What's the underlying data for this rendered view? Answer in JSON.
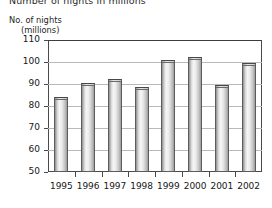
{
  "chart_data": {
    "type": "bar",
    "title": "Number of nights in millions",
    "ylabel_line1": "No. of nights",
    "ylabel_line2": "(millions)",
    "xlabel": "",
    "categories": [
      "1995",
      "1996",
      "1997",
      "1998",
      "1999",
      "2000",
      "2001",
      "2002"
    ],
    "values": [
      84,
      90.5,
      92.5,
      88.5,
      101,
      102.5,
      89.5,
      99.5
    ],
    "ylim": [
      50,
      110
    ],
    "yticks": [
      110,
      100,
      90,
      80,
      70,
      60,
      50
    ],
    "ytick_labels": [
      "110",
      "100",
      "90",
      "80",
      "70",
      "60",
      "50"
    ],
    "grid": true,
    "legend": null,
    "series_name": "No. of nights (millions)",
    "bar_color": "#e4e4e4",
    "bar_edge_color": "#5c5c5c",
    "grid_color": "#b9b9b9",
    "axis_color": "#4a4a4a",
    "text_color": "#171717"
  }
}
